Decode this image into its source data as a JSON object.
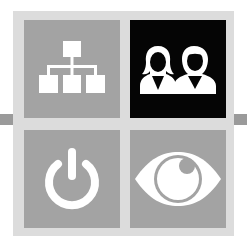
{
  "colors": {
    "background": "#ffffff",
    "frame": "#dcdcdc",
    "connector_bar": "#9a9a9a",
    "tile_default": "#a3a3a3",
    "tile_active": "#050505",
    "icon": "#ffffff"
  },
  "tiles": [
    {
      "id": "hierarchy",
      "icon": "sitemap-icon",
      "active": false
    },
    {
      "id": "users",
      "icon": "users-icon",
      "active": true
    },
    {
      "id": "power",
      "icon": "power-icon",
      "active": false
    },
    {
      "id": "view",
      "icon": "eye-icon",
      "active": false
    }
  ]
}
